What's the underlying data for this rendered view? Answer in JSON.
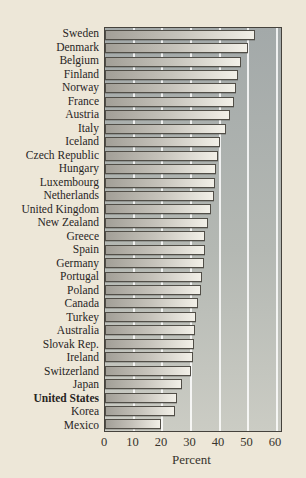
{
  "chart_data": {
    "type": "bar",
    "orientation": "horizontal",
    "title": "",
    "xlabel": "Percent",
    "xlim": [
      0,
      60
    ],
    "xticks": [
      0,
      10,
      20,
      30,
      40,
      50,
      60
    ],
    "grid": "vertical white gridlines every 10 units, drawn behind bars",
    "legend": "none",
    "highlighted_category": "United States",
    "categories": [
      "Sweden",
      "Denmark",
      "Belgium",
      "Finland",
      "Norway",
      "France",
      "Austria",
      "Italy",
      "Iceland",
      "Czech Republic",
      "Hungary",
      "Luxembourg",
      "Netherlands",
      "United Kingdom",
      "New Zealand",
      "Greece",
      "Spain",
      "Germany",
      "Portugal",
      "Poland",
      "Canada",
      "Turkey",
      "Australia",
      "Slovak Rep.",
      "Ireland",
      "Switzerland",
      "Japan",
      "United States",
      "Korea",
      "Mexico"
    ],
    "values": [
      52.5,
      50.0,
      47.3,
      46.4,
      45.7,
      45.0,
      43.6,
      42.3,
      40.3,
      39.5,
      38.8,
      38.5,
      38.0,
      37.1,
      35.8,
      35.0,
      34.8,
      34.6,
      33.7,
      33.4,
      32.6,
      31.7,
      31.4,
      31.1,
      30.7,
      29.9,
      26.7,
      25.1,
      24.4,
      19.7
    ],
    "colors": {
      "page_background": "#ede7d8",
      "plot_background_top": "#a3a9a9",
      "plot_background_bottom": "#cbccc4",
      "bar_fill_left": "#a29f97",
      "bar_fill_right": "#f2f0e8",
      "bar_border": "#514e47",
      "frame_border": "#45423c",
      "gridline": "#ffffff",
      "text": "#28251f"
    }
  }
}
